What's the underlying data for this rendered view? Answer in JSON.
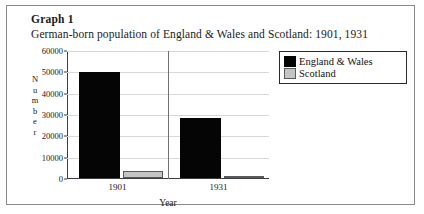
{
  "figure": {
    "label": "Graph 1",
    "subtitle": "German-born population of England & Wales and Scotland: 1901, 1931"
  },
  "axis": {
    "y_title_letters": [
      "N",
      "u",
      "m",
      "b",
      "e",
      "r"
    ],
    "x_title": "Year"
  },
  "legend": {
    "items": [
      {
        "label": "England & Wales",
        "color": "#050505",
        "swatch": "black"
      },
      {
        "label": "Scotland",
        "color": "#c4c4c4",
        "swatch": "grey"
      }
    ]
  },
  "chart_data": {
    "type": "bar",
    "title": "German-born population of England & Wales and Scotland: 1901, 1931",
    "xlabel": "Year",
    "ylabel": "Number",
    "categories": [
      "1901",
      "1931"
    ],
    "series": [
      {
        "name": "England & Wales",
        "color": "#050505",
        "values": [
          50000,
          28500
        ]
      },
      {
        "name": "Scotland",
        "color": "#c4c4c4",
        "values": [
          3300,
          1000
        ]
      }
    ],
    "ylim": [
      0,
      60000
    ],
    "yticks": [
      0,
      10000,
      20000,
      30000,
      40000,
      50000,
      60000
    ],
    "ytick_labels": [
      "0",
      "10000",
      "20000",
      "30000",
      "40000",
      "50000",
      "60000"
    ],
    "grid": true,
    "legend_position": "top-right"
  }
}
